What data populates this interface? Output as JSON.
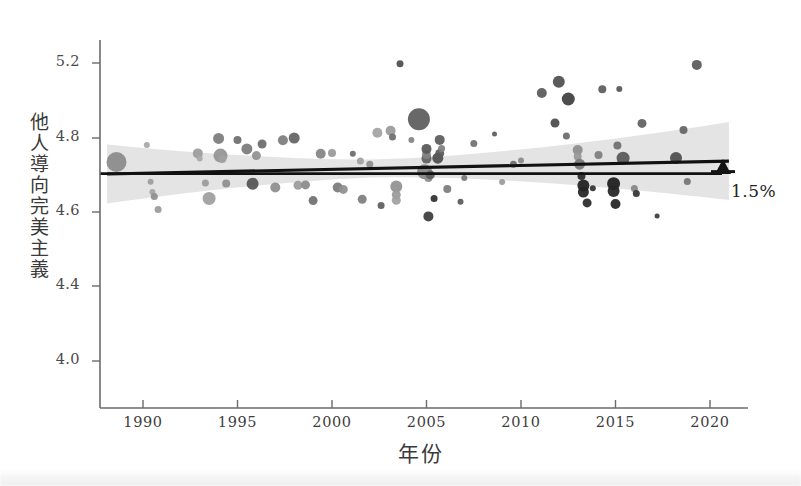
{
  "chart_data": {
    "type": "scatter",
    "title": "",
    "xlabel": "年份",
    "ylabel": "他人導向完美主義",
    "xlim": [
      1987.5,
      2021.5
    ],
    "ylim": [
      3.88,
      5.32
    ],
    "grid": false,
    "legend": null,
    "xticks": [
      1990,
      1995,
      2000,
      2005,
      2010,
      2015,
      2020
    ],
    "yticks": [
      5.2,
      4.8,
      4.6,
      4.4,
      4.0
    ],
    "annotations": [
      {
        "text": "1.5%",
        "icon": "up-arrow",
        "x": 2021,
        "meaning": "increase from start to end of trend line"
      }
    ],
    "reference_line": {
      "type": "horizontal",
      "y": 4.61,
      "label": "baseline"
    },
    "trend_line": {
      "type": "linear-regression",
      "x_start": 1988.1,
      "y_start": 4.608,
      "x_end": 2021.0,
      "y_end": 4.677,
      "confidence_band": "95%"
    },
    "points": [
      {
        "x": 1988.6,
        "y": 4.672,
        "size": 20,
        "shade": "#8b8b8b"
      },
      {
        "x": 1990.2,
        "y": 4.762,
        "size": 6,
        "shade": "#a8a8a8"
      },
      {
        "x": 1990.4,
        "y": 4.567,
        "size": 6,
        "shade": "#9d9d9d"
      },
      {
        "x": 1990.5,
        "y": 4.512,
        "size": 6,
        "shade": "#a5a5a5"
      },
      {
        "x": 1990.6,
        "y": 4.488,
        "size": 7,
        "shade": "#8f8f8f"
      },
      {
        "x": 1990.8,
        "y": 4.418,
        "size": 7,
        "shade": "#9a9a9a"
      },
      {
        "x": 1992.9,
        "y": 4.718,
        "size": 10,
        "shade": "#9c9c9c"
      },
      {
        "x": 1993.0,
        "y": 4.69,
        "size": 6,
        "shade": "#aaaaaa"
      },
      {
        "x": 1993.3,
        "y": 4.56,
        "size": 7,
        "shade": "#9b9b9b"
      },
      {
        "x": 1993.5,
        "y": 4.478,
        "size": 13,
        "shade": "#9e9e9e"
      },
      {
        "x": 1994.0,
        "y": 4.798,
        "size": 11,
        "shade": "#7c7c7c"
      },
      {
        "x": 1994.1,
        "y": 4.706,
        "size": 14,
        "shade": "#939393"
      },
      {
        "x": 1994.2,
        "y": 4.688,
        "size": 8,
        "shade": "#a0a0a0"
      },
      {
        "x": 1994.4,
        "y": 4.557,
        "size": 8,
        "shade": "#8e8e8e"
      },
      {
        "x": 1995.0,
        "y": 4.789,
        "size": 8,
        "shade": "#6e6e6e"
      },
      {
        "x": 1995.5,
        "y": 4.742,
        "size": 11,
        "shade": "#7b7b7b"
      },
      {
        "x": 1995.8,
        "y": 4.556,
        "size": 12,
        "shade": "#555555"
      },
      {
        "x": 1996.0,
        "y": 4.706,
        "size": 9,
        "shade": "#919191"
      },
      {
        "x": 1996.3,
        "y": 4.768,
        "size": 9,
        "shade": "#6b6b6b"
      },
      {
        "x": 1997.0,
        "y": 4.536,
        "size": 10,
        "shade": "#8d8d8d"
      },
      {
        "x": 1997.4,
        "y": 4.788,
        "size": 10,
        "shade": "#7d7d7d"
      },
      {
        "x": 1998.0,
        "y": 4.8,
        "size": 11,
        "shade": "#636363"
      },
      {
        "x": 1998.2,
        "y": 4.548,
        "size": 9,
        "shade": "#9b9b9b"
      },
      {
        "x": 1998.6,
        "y": 4.55,
        "size": 9,
        "shade": "#8a8a8a"
      },
      {
        "x": 1999.0,
        "y": 4.466,
        "size": 9,
        "shade": "#6f6f6f"
      },
      {
        "x": 1999.4,
        "y": 4.716,
        "size": 10,
        "shade": "#838383"
      },
      {
        "x": 2000.0,
        "y": 4.72,
        "size": 8,
        "shade": "#999999"
      },
      {
        "x": 2000.3,
        "y": 4.536,
        "size": 10,
        "shade": "#7a7a7a"
      },
      {
        "x": 2000.6,
        "y": 4.526,
        "size": 9,
        "shade": "#8f8f8f"
      },
      {
        "x": 2001.1,
        "y": 4.716,
        "size": 6,
        "shade": "#6a6a6a"
      },
      {
        "x": 2001.6,
        "y": 4.473,
        "size": 9,
        "shade": "#7e7e7e"
      },
      {
        "x": 2002.4,
        "y": 4.828,
        "size": 10,
        "shade": "#a2a2a2"
      },
      {
        "x": 2003.1,
        "y": 5.228,
        "size": 10,
        "shade": "#9a9a9a"
      },
      {
        "x": 2003.2,
        "y": 4.806,
        "size": 7,
        "shade": "#6e6e6e"
      },
      {
        "x": 2003.6,
        "y": 5.196,
        "size": 7,
        "shade": "#4e4e4e"
      },
      {
        "x": 2004.2,
        "y": 4.79,
        "size": 6,
        "shade": "#848484"
      },
      {
        "x": 2004.6,
        "y": 4.9,
        "size": 22,
        "shade": "#5d5d5d"
      },
      {
        "x": 2004.9,
        "y": 4.62,
        "size": 15,
        "shade": "#868686"
      },
      {
        "x": 2005.0,
        "y": 4.69,
        "size": 10,
        "shade": "#616161"
      },
      {
        "x": 2005.0,
        "y": 4.712,
        "size": 9,
        "shade": "#838383"
      },
      {
        "x": 2005.0,
        "y": 4.742,
        "size": 10,
        "shade": "#575757"
      },
      {
        "x": 2005.1,
        "y": 4.382,
        "size": 10,
        "shade": "#3b3b3b"
      },
      {
        "x": 2005.1,
        "y": 4.586,
        "size": 8,
        "shade": "#8b8b8b"
      },
      {
        "x": 2005.2,
        "y": 4.603,
        "size": 9,
        "shade": "#5e5e5e"
      },
      {
        "x": 2005.4,
        "y": 4.478,
        "size": 7,
        "shade": "#2f2f2f"
      },
      {
        "x": 2005.6,
        "y": 4.692,
        "size": 11,
        "shade": "#4d4d4d"
      },
      {
        "x": 2005.7,
        "y": 4.718,
        "size": 9,
        "shade": "#5a5a5a"
      },
      {
        "x": 2005.7,
        "y": 4.79,
        "size": 10,
        "shade": "#5b5b5b"
      },
      {
        "x": 2005.8,
        "y": 4.744,
        "size": 7,
        "shade": "#808080"
      },
      {
        "x": 2006.1,
        "y": 4.528,
        "size": 8,
        "shade": "#7c7c7c"
      },
      {
        "x": 2006.8,
        "y": 4.46,
        "size": 6,
        "shade": "#5a5a5a"
      },
      {
        "x": 2003.4,
        "y": 4.541,
        "size": 12,
        "shade": "#919191"
      },
      {
        "x": 2003.4,
        "y": 4.497,
        "size": 9,
        "shade": "#9a9a9a"
      },
      {
        "x": 2003.4,
        "y": 4.468,
        "size": 9,
        "shade": "#a0a0a0"
      },
      {
        "x": 2002.6,
        "y": 4.44,
        "size": 7,
        "shade": "#5e5e5e"
      },
      {
        "x": 2001.5,
        "y": 4.678,
        "size": 7,
        "shade": "#a1a1a1"
      },
      {
        "x": 2002.0,
        "y": 4.66,
        "size": 7,
        "shade": "#8d8d8d"
      },
      {
        "x": 2007.5,
        "y": 4.77,
        "size": 7,
        "shade": "#717171"
      },
      {
        "x": 2008.6,
        "y": 5.21,
        "size": 5,
        "shade": "#5d5d5d"
      },
      {
        "x": 2009.6,
        "y": 4.66,
        "size": 7,
        "shade": "#6c6c6c"
      },
      {
        "x": 2011.1,
        "y": 5.04,
        "size": 10,
        "shade": "#5a5a5a"
      },
      {
        "x": 2011.8,
        "y": 4.88,
        "size": 9,
        "shade": "#4a4a4a"
      },
      {
        "x": 2012.0,
        "y": 5.1,
        "size": 12,
        "shade": "#4f4f4f"
      },
      {
        "x": 2012.4,
        "y": 4.81,
        "size": 7,
        "shade": "#6a6a6a"
      },
      {
        "x": 2012.5,
        "y": 5.008,
        "size": 13,
        "shade": "#3f3f3f"
      },
      {
        "x": 2013.0,
        "y": 4.736,
        "size": 10,
        "shade": "#8d8d8d"
      },
      {
        "x": 2013.0,
        "y": 4.702,
        "size": 8,
        "shade": "#989898"
      },
      {
        "x": 2013.1,
        "y": 4.66,
        "size": 11,
        "shade": "#777777"
      },
      {
        "x": 2013.2,
        "y": 4.598,
        "size": 8,
        "shade": "#2b2b2b"
      },
      {
        "x": 2013.3,
        "y": 4.546,
        "size": 12,
        "shade": "#1f1f1f"
      },
      {
        "x": 2013.3,
        "y": 4.512,
        "size": 11,
        "shade": "#242424"
      },
      {
        "x": 2013.5,
        "y": 4.454,
        "size": 9,
        "shade": "#2a2a2a"
      },
      {
        "x": 2013.8,
        "y": 4.532,
        "size": 6,
        "shade": "#333333"
      },
      {
        "x": 2014.1,
        "y": 4.71,
        "size": 8,
        "shade": "#7e7e7e"
      },
      {
        "x": 2014.3,
        "y": 5.06,
        "size": 8,
        "shade": "#5c5c5c"
      },
      {
        "x": 2014.9,
        "y": 4.556,
        "size": 13,
        "shade": "#1d1d1d"
      },
      {
        "x": 2014.9,
        "y": 4.518,
        "size": 12,
        "shade": "#262626"
      },
      {
        "x": 2015.0,
        "y": 4.448,
        "size": 10,
        "shade": "#222222"
      },
      {
        "x": 2015.1,
        "y": 4.76,
        "size": 8,
        "shade": "#6f6f6f"
      },
      {
        "x": 2015.2,
        "y": 5.062,
        "size": 6,
        "shade": "#555555"
      },
      {
        "x": 2015.4,
        "y": 4.692,
        "size": 13,
        "shade": "#585858"
      },
      {
        "x": 2016.0,
        "y": 4.53,
        "size": 7,
        "shade": "#888888"
      },
      {
        "x": 2016.1,
        "y": 4.504,
        "size": 7,
        "shade": "#343434"
      },
      {
        "x": 2016.4,
        "y": 4.878,
        "size": 9,
        "shade": "#616161"
      },
      {
        "x": 2017.2,
        "y": 4.384,
        "size": 5,
        "shade": "#3a3a3a"
      },
      {
        "x": 2018.2,
        "y": 4.694,
        "size": 12,
        "shade": "#4d4d4d"
      },
      {
        "x": 2018.6,
        "y": 4.842,
        "size": 8,
        "shade": "#646464"
      },
      {
        "x": 2018.8,
        "y": 4.568,
        "size": 7,
        "shade": "#757575"
      },
      {
        "x": 2019.3,
        "y": 5.19,
        "size": 10,
        "shade": "#5a5a5a"
      },
      {
        "x": 2010.0,
        "y": 4.68,
        "size": 6,
        "shade": "#8a8a8a"
      },
      {
        "x": 2009.0,
        "y": 4.565,
        "size": 6,
        "shade": "#9a9a9a"
      },
      {
        "x": 2007.0,
        "y": 4.586,
        "size": 6,
        "shade": "#787878"
      }
    ]
  },
  "axis": {
    "y_title": "他人導向完美主義",
    "y_title_chars": [
      "他",
      "人",
      "導",
      "向",
      "完",
      "美",
      "主",
      "義"
    ],
    "x_title": "年份",
    "y_tick_labels": [
      "5.2",
      "4.8",
      "4.6",
      "4.4",
      "4.0"
    ],
    "x_tick_labels": [
      "1990",
      "1995",
      "2000",
      "2005",
      "2010",
      "2015",
      "2020"
    ]
  },
  "annotation": {
    "change_label": "1.5%",
    "arrow": "↑"
  },
  "colors": {
    "axis": "#6b6b6b",
    "trend_line": "#111111",
    "reference_line": "#111111",
    "band": "#d9d9d9",
    "text": "#3a3a3a",
    "background": "#ffffff"
  }
}
